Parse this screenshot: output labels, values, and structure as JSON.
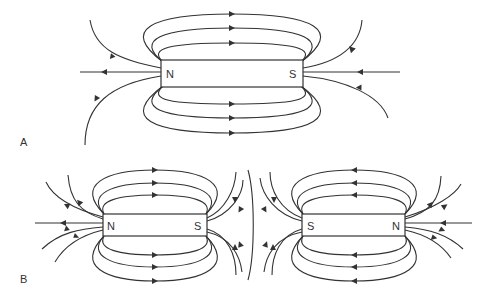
{
  "figure": {
    "panels": [
      {
        "id": "A",
        "label": "A",
        "description": "Single bar magnet with field lines",
        "magnets": [
          {
            "left_pole": "N",
            "right_pole": "S"
          }
        ]
      },
      {
        "id": "B",
        "label": "B",
        "description": "Two bar magnets with like (S) poles facing each other, showing repulsion field pattern",
        "magnets": [
          {
            "left_pole": "N",
            "right_pole": "S"
          },
          {
            "left_pole": "S",
            "right_pole": "N"
          }
        ]
      }
    ],
    "colors": {
      "line": "#333333",
      "background": "#ffffff"
    }
  }
}
